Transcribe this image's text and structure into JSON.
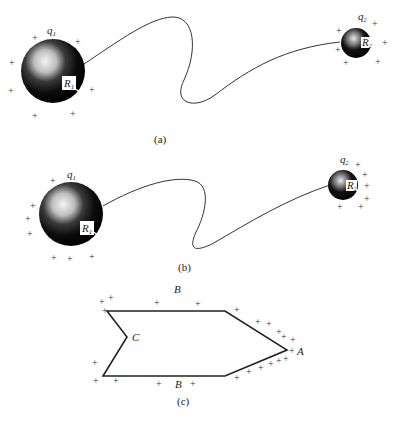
{
  "figure": {
    "panels": [
      {
        "id": "a",
        "caption": "(a)",
        "sphere1": {
          "charge_label": "q",
          "charge_sub": "1",
          "radius_label": "R",
          "radius_sub": "1"
        },
        "sphere2": {
          "charge_label": "q",
          "charge_sub": "2",
          "radius_label": "R",
          "radius_sub": "2"
        },
        "charge_sign": "+"
      },
      {
        "id": "b",
        "caption": "(b)",
        "sphere1": {
          "charge_label": "q",
          "charge_sub": "1",
          "radius_label": "R",
          "radius_sub": "1"
        },
        "sphere2": {
          "charge_label": "q",
          "charge_sub": "2",
          "radius_label": "R",
          "radius_sub": "2"
        },
        "charge_sign": "+"
      },
      {
        "id": "c",
        "caption": "(c)",
        "labels": {
          "top": "B",
          "bottom": "B",
          "notch": "C",
          "tip": "A"
        },
        "charge_sign": "+"
      }
    ]
  }
}
